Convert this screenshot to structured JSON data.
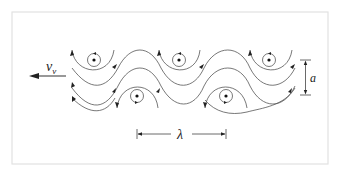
{
  "diagram": {
    "title": "",
    "labels": {
      "velocity_symbol": "v",
      "velocity_subscript": "v",
      "amplitude": "a",
      "wavelength": "λ"
    },
    "vortices_top": [
      {
        "x": 94,
        "y": 60,
        "rotation": "counterclockwise"
      },
      {
        "x": 179,
        "y": 60,
        "rotation": "counterclockwise"
      },
      {
        "x": 269,
        "y": 60,
        "rotation": "counterclockwise"
      }
    ],
    "vortices_bottom": [
      {
        "x": 137,
        "y": 96,
        "rotation": "clockwise"
      },
      {
        "x": 226,
        "y": 96,
        "rotation": "clockwise"
      }
    ],
    "colors": {
      "stroke": "#555555",
      "frame": "#e2e2e2",
      "text": "#222222"
    }
  }
}
